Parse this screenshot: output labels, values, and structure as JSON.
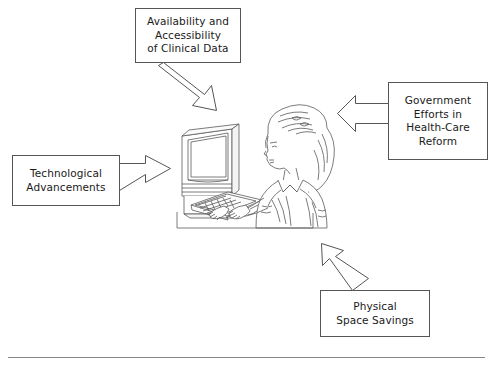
{
  "diagram": {
    "center_illustration": {
      "name": "woman-at-computer-terminal",
      "description": "Line drawing of a woman in profile seated at a desk typing on a keyboard in front of a CRT computer monitor",
      "elements": [
        "computer-monitor",
        "keyboard",
        "desk",
        "seated-person"
      ]
    },
    "boxes": [
      {
        "id": "availability",
        "position": "top",
        "lines": [
          "Availability and",
          "Accessibility",
          "of Clinical Data"
        ],
        "arrow_direction": "down-right"
      },
      {
        "id": "government",
        "position": "right",
        "lines": [
          "Government",
          "Efforts in",
          "Health-Care",
          "Reform"
        ],
        "arrow_direction": "left"
      },
      {
        "id": "technological",
        "position": "left",
        "lines": [
          "Technological",
          "Advancements"
        ],
        "arrow_direction": "right"
      },
      {
        "id": "physical",
        "position": "bottom-right",
        "lines": [
          "Physical",
          "Space Savings"
        ],
        "arrow_direction": "up-left"
      }
    ],
    "colors": {
      "background": "#ffffff",
      "stroke": "#555555",
      "text": "#1a1a1a",
      "rule": "#888888"
    },
    "footer_rule": true
  }
}
